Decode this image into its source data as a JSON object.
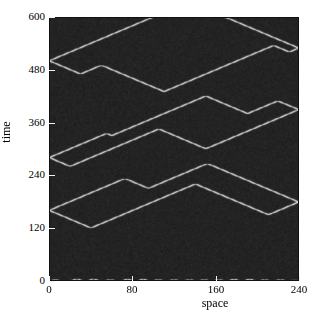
{
  "figure": {
    "kind": "spacetime-diagram",
    "background_color": "#ffffff",
    "plot": {
      "left": 49,
      "top": 17,
      "width": 250,
      "height": 264
    }
  },
  "axes": {
    "x": {
      "label": "space",
      "min": 0,
      "max": 240,
      "ticks": [
        0,
        80,
        160,
        240
      ],
      "tick_labels": [
        "0",
        "80",
        "160",
        "240"
      ]
    },
    "y": {
      "label": "time",
      "min": 0,
      "max": 600,
      "direction": "up",
      "ticks": [
        0,
        120,
        240,
        360,
        480,
        600
      ],
      "tick_labels": [
        "0",
        "120",
        "240",
        "360",
        "480",
        "600"
      ]
    }
  },
  "chart_data": {
    "type": "heatmap",
    "title": "",
    "xlabel": "space",
    "ylabel": "time",
    "xlim": [
      0,
      240
    ],
    "ylim": [
      0,
      600
    ],
    "grid": false,
    "legend": "none",
    "colormap": "gray",
    "value_range": [
      0,
      1
    ],
    "dark_color": "#242424",
    "bright_color": "#f4f4f4",
    "mid_color": "#585858",
    "wall_speed_cells_per_step": 1,
    "wall_width_cells": 3,
    "noise_amplitude": 0.1,
    "nx": 240,
    "nt": 600,
    "initial_walls": [
      {
        "x": 3,
        "v": 1
      },
      {
        "x": 9,
        "v": -1
      },
      {
        "x": 22,
        "v": 1
      },
      {
        "x": 31,
        "v": -1
      },
      {
        "x": 38,
        "v": 1
      },
      {
        "x": 47,
        "v": -1
      },
      {
        "x": 55,
        "v": 1
      },
      {
        "x": 62,
        "v": -1
      },
      {
        "x": 71,
        "v": 1
      },
      {
        "x": 79,
        "v": -1
      },
      {
        "x": 86,
        "v": 1
      },
      {
        "x": 94,
        "v": -1
      },
      {
        "x": 101,
        "v": 1
      },
      {
        "x": 108,
        "v": -1
      },
      {
        "x": 116,
        "v": 1
      },
      {
        "x": 123,
        "v": -1
      },
      {
        "x": 131,
        "v": 1
      },
      {
        "x": 138,
        "v": -1
      },
      {
        "x": 145,
        "v": 1
      },
      {
        "x": 152,
        "v": -1
      },
      {
        "x": 159,
        "v": 1
      },
      {
        "x": 166,
        "v": -1
      },
      {
        "x": 173,
        "v": 1
      },
      {
        "x": 181,
        "v": -1
      },
      {
        "x": 188,
        "v": 1
      },
      {
        "x": 196,
        "v": -1
      },
      {
        "x": 203,
        "v": 1
      },
      {
        "x": 210,
        "v": -1
      },
      {
        "x": 218,
        "v": 1
      },
      {
        "x": 225,
        "v": -1
      },
      {
        "x": 233,
        "v": 1
      },
      {
        "x": 238,
        "v": -1
      }
    ],
    "seeded_events": [
      {
        "time": 120,
        "x": 40,
        "note": "pair nucleation"
      },
      {
        "time": 150,
        "x": 210,
        "note": "pair nucleation"
      },
      {
        "time": 210,
        "x": 95,
        "note": "pair nucleation"
      },
      {
        "time": 260,
        "x": 20,
        "note": "pair nucleation"
      },
      {
        "time": 300,
        "x": 150,
        "note": "pair nucleation"
      },
      {
        "time": 330,
        "x": 60,
        "note": "pair nucleation"
      },
      {
        "time": 380,
        "x": 190,
        "note": "pair nucleation"
      },
      {
        "time": 430,
        "x": 110,
        "note": "pair nucleation"
      },
      {
        "time": 470,
        "x": 30,
        "note": "pair nucleation"
      },
      {
        "time": 520,
        "x": 230,
        "note": "pair nucleation"
      }
    ]
  }
}
